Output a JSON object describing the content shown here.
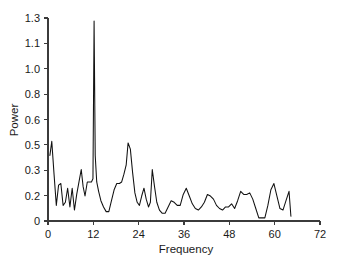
{
  "chart_data": {
    "type": "line",
    "title": "",
    "xlabel": "Frequency",
    "ylabel": "Power",
    "xlim": [
      0,
      72
    ],
    "ylim": [
      0,
      1.3
    ],
    "grid": false,
    "legend": "none",
    "xticks": [
      0,
      12,
      24,
      36,
      48,
      60,
      72
    ],
    "xtick_labels": [
      "0",
      "12",
      "24",
      "36",
      "48",
      "60",
      "72"
    ],
    "yticks": [
      0,
      0.2,
      0.3,
      0.5,
      0.6,
      0.8,
      1.0,
      1.1,
      1.3
    ],
    "ytick_labels": [
      "0",
      "0.2",
      "0.3",
      "0.5",
      "0.6",
      "0.8",
      "1.0",
      "1.1",
      "1.3"
    ],
    "series": [
      {
        "name": "Power spectrum",
        "color": "#111111",
        "x": [
          0.5,
          1.0,
          1.6,
          2.2,
          2.8,
          3.4,
          4.0,
          4.6,
          5.2,
          5.8,
          6.4,
          7.0,
          7.6,
          8.2,
          8.8,
          9.3,
          9.8,
          10.4,
          11.0,
          11.5,
          11.9,
          12.2,
          12.5,
          12.9,
          13.4,
          14.0,
          14.7,
          15.4,
          16.1,
          16.8,
          17.5,
          18.2,
          18.9,
          19.5,
          20.1,
          20.7,
          21.2,
          21.8,
          22.4,
          23.0,
          23.6,
          24.2,
          24.8,
          25.4,
          26.0,
          26.6,
          27.1,
          27.6,
          28.2,
          28.8,
          29.5,
          30.2,
          31.0,
          31.8,
          32.6,
          33.4,
          34.2,
          35.0,
          35.8,
          36.6,
          37.4,
          38.2,
          39.0,
          39.8,
          40.6,
          41.4,
          42.2,
          43.0,
          43.8,
          44.6,
          45.4,
          46.2,
          47.0,
          47.8,
          48.6,
          49.4,
          50.2,
          51.0,
          51.8,
          52.6,
          53.4,
          54.2,
          55.0,
          55.8,
          56.6,
          57.4,
          58.2,
          59.0,
          59.8,
          60.6,
          61.4,
          62.2,
          63.0,
          63.8,
          64.3
        ],
        "y": [
          0.42,
          0.51,
          0.3,
          0.1,
          0.23,
          0.24,
          0.1,
          0.12,
          0.21,
          0.09,
          0.21,
          0.07,
          0.17,
          0.25,
          0.33,
          0.22,
          0.16,
          0.25,
          0.25,
          0.25,
          0.27,
          1.28,
          0.42,
          0.25,
          0.19,
          0.13,
          0.09,
          0.06,
          0.06,
          0.13,
          0.2,
          0.24,
          0.24,
          0.25,
          0.3,
          0.36,
          0.5,
          0.46,
          0.31,
          0.18,
          0.12,
          0.1,
          0.16,
          0.21,
          0.14,
          0.09,
          0.12,
          0.33,
          0.22,
          0.12,
          0.07,
          0.05,
          0.05,
          0.09,
          0.13,
          0.12,
          0.1,
          0.1,
          0.17,
          0.21,
          0.16,
          0.11,
          0.08,
          0.07,
          0.09,
          0.12,
          0.17,
          0.16,
          0.14,
          0.1,
          0.08,
          0.07,
          0.09,
          0.09,
          0.11,
          0.08,
          0.13,
          0.19,
          0.17,
          0.17,
          0.18,
          0.14,
          0.08,
          0.02,
          0.02,
          0.02,
          0.1,
          0.2,
          0.24,
          0.16,
          0.08,
          0.07,
          0.13,
          0.19,
          0.03
        ]
      }
    ]
  },
  "axes": {
    "y_title": "Power",
    "x_title": "Frequency"
  }
}
